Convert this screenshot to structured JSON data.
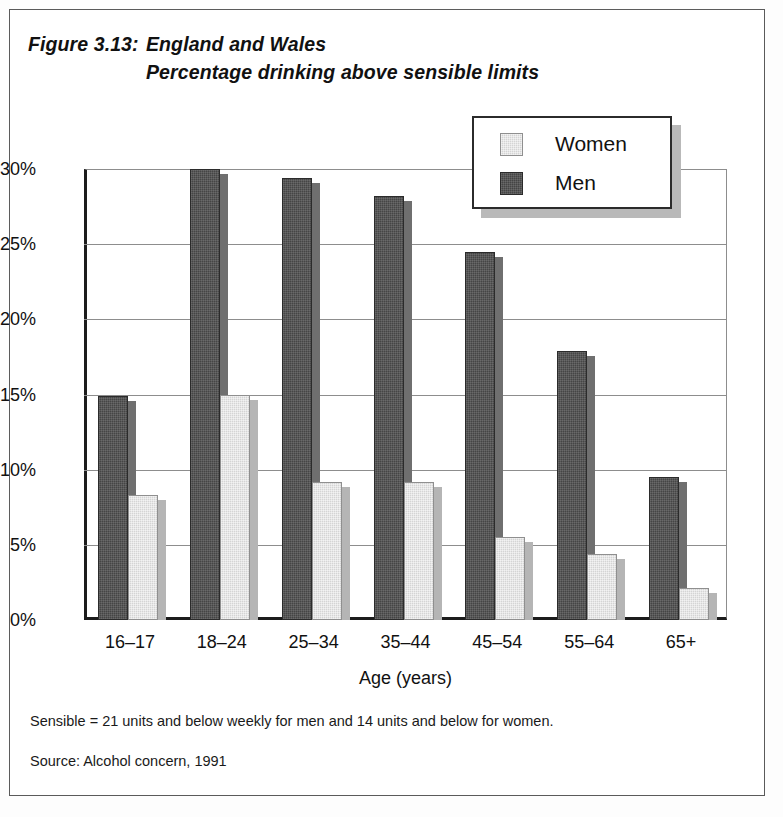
{
  "figure": {
    "label": "Figure 3.13:",
    "title_line1": "England and Wales",
    "title_line2": "Percentage drinking above sensible limits"
  },
  "legend": {
    "items": [
      {
        "label": "Women",
        "swatch": "women-swatch",
        "color": "#d4d4d4"
      },
      {
        "label": "Men",
        "swatch": "men-swatch",
        "color": "#454545"
      }
    ]
  },
  "footnotes": {
    "sensible": "Sensible = 21 units and below weekly for men and 14 units and below for women.",
    "source": "Source: Alcohol concern, 1991"
  },
  "chart_data": {
    "type": "bar",
    "xlabel": "Age (years)",
    "ylabel": "",
    "categories": [
      "16–17",
      "18–24",
      "25–34",
      "35–44",
      "45–54",
      "55–64",
      "65+"
    ],
    "series": [
      {
        "name": "Men",
        "color": "#454545",
        "values": [
          14.9,
          30.0,
          29.4,
          28.2,
          24.5,
          17.9,
          9.5
        ]
      },
      {
        "name": "Women",
        "color": "#d4d4d4",
        "values": [
          8.3,
          15.0,
          9.2,
          9.2,
          5.5,
          4.4,
          2.1
        ]
      }
    ],
    "ylim": [
      0,
      30
    ],
    "yticks": [
      0,
      5,
      10,
      15,
      20,
      25,
      30
    ],
    "ytick_labels": [
      "0%",
      "5%",
      "10%",
      "15%",
      "20%",
      "25%",
      "30%"
    ],
    "grid": true,
    "legend_position": "top-right",
    "bar_order": [
      "Men",
      "Women"
    ],
    "style": "3d-shaded"
  }
}
